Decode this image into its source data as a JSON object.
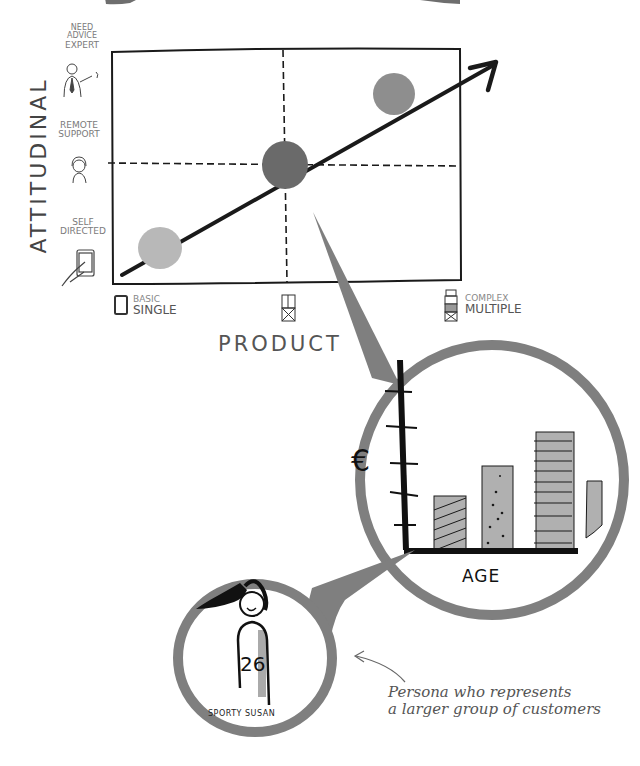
{
  "diagram": {
    "type": "customer-segmentation-sketch",
    "y_axis": {
      "title": "ATTITUDINAL",
      "levels": [
        {
          "label_line1": "NEED",
          "label_line2": "ADVICE",
          "label_line3": "EXPERT",
          "icon": "expert-person-icon"
        },
        {
          "label_line1": "REMOTE",
          "label_line2": "SUPPORT",
          "icon": "headset-person-icon"
        },
        {
          "label_line1": "SELF",
          "label_line2": "DIRECTED",
          "icon": "tablet-hand-icon"
        }
      ]
    },
    "x_axis": {
      "title": "PRODUCT",
      "categories": [
        {
          "label_line1": "BASIC",
          "label_line2": "SINGLE",
          "icon": "single-box-icon"
        },
        {
          "label_line1": "",
          "label_line2": "",
          "icon": "double-box-icon"
        },
        {
          "label_line1": "COMPLEX",
          "label_line2": "MULTIPLE",
          "icon": "stacked-boxes-icon"
        }
      ]
    },
    "segments": [
      {
        "name": "low",
        "x": "BASIC SINGLE",
        "y": "SELF DIRECTED",
        "color": "#b8b8b8"
      },
      {
        "name": "mid",
        "x": "middle",
        "y": "REMOTE SUPPORT",
        "color": "#6a6a6a"
      },
      {
        "name": "high",
        "x": "COMPLEX MULTIPLE",
        "y": "NEED ADVICE EXPERT",
        "color": "#8e8e8e"
      }
    ],
    "trend_arrow": "diagonal up-right"
  },
  "magnifier_chart": {
    "y_label": "€",
    "x_label": "AGE",
    "bars": [
      {
        "pattern": "diagonal-hatch",
        "relative_height": 0.4
      },
      {
        "pattern": "dots",
        "relative_height": 0.62
      },
      {
        "pattern": "horizontal-lines",
        "relative_height": 0.88
      },
      {
        "pattern": "plain",
        "relative_height": 0.5
      }
    ]
  },
  "persona": {
    "name": "SPORTY SUSAN",
    "number": "26"
  },
  "caption": {
    "line1": "Persona who represents",
    "line2": "a larger group of customers"
  },
  "colors": {
    "ink": "#1a1a1a",
    "magnifier_gray": "#7f7f7f",
    "label_gray": "#7a7a7a",
    "bar_fill": "#b0b0b0"
  }
}
